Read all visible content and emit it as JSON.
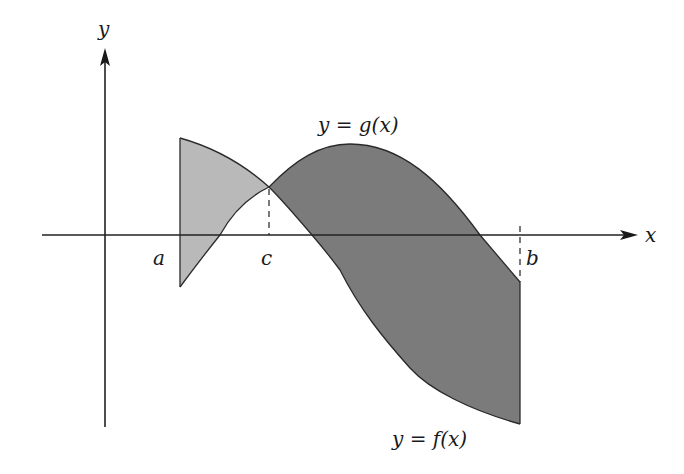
{
  "diagram": {
    "type": "area-between-curves",
    "axes": {
      "x_label": "x",
      "y_label": "y"
    },
    "curves": [
      {
        "name": "g",
        "label": "y = g(x)",
        "description": "rises from below axis at a, peaks between c and b, falls below axis before b"
      },
      {
        "name": "f",
        "label": "y = f(x)",
        "description": "starts high at a, decreases monotonically, ends well below axis at b"
      }
    ],
    "points": {
      "a": {
        "label": "a"
      },
      "c": {
        "label": "c",
        "note": "intersection of f and g"
      },
      "b": {
        "label": "b"
      }
    },
    "regions": [
      {
        "name": "region-a-to-c",
        "between": "a and c",
        "top_curve": "f",
        "bottom_curve": "g",
        "shade": "light",
        "color": "#b8b8b8"
      },
      {
        "name": "region-c-to-b",
        "between": "c and b",
        "top_curve": "g",
        "bottom_curve": "f",
        "shade": "dark",
        "color": "#7a7a7a"
      }
    ],
    "colors": {
      "light_region": "#b8b8b8",
      "dark_region": "#7a7a7a",
      "lines": "#222222",
      "background": "#ffffff"
    }
  }
}
